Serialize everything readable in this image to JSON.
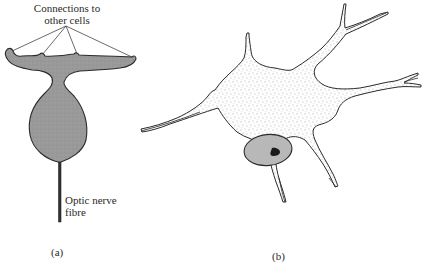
{
  "figure": {
    "panel_a": {
      "label": "(a)",
      "annotation_top": {
        "line1": "Connections to",
        "line2": "other cells"
      },
      "annotation_fibre": {
        "line1": "Optic nerve",
        "line2": "fibre"
      }
    },
    "panel_b": {
      "label": "(b)"
    }
  },
  "colors": {
    "cell_fill_a": "#9a9a9a",
    "outline": "#2b2b2b",
    "stipple_bg": "#ffffff",
    "nucleus_fill": "#b8b8b8",
    "nucleolus_fill": "#1a1a1a"
  }
}
